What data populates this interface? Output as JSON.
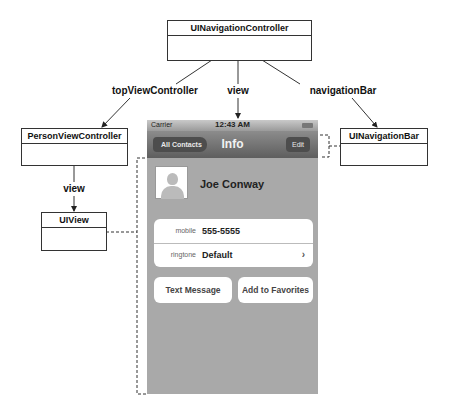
{
  "diagram": {
    "nodes": {
      "nav_controller": "UINavigationController",
      "person_vc": "PersonViewController",
      "ui_view": "UIView",
      "nav_bar": "UINavigationBar"
    },
    "edges": {
      "top_vc": "topViewController",
      "view_top": "view",
      "nav_bar": "navigationBar",
      "view_left": "view"
    }
  },
  "phone": {
    "status": {
      "carrier": "Carrier",
      "time": "12:43 AM"
    },
    "navbar": {
      "back": "All Contacts",
      "title": "Info",
      "edit": "Edit"
    },
    "contact": {
      "name": "Joe Conway"
    },
    "rows": [
      {
        "key": "mobile",
        "value": "555-5555"
      },
      {
        "key": "ringtone",
        "value": "Default",
        "chevron": "›"
      }
    ],
    "buttons": {
      "text_message": "Text Message",
      "add_favorites": "Add to Favorites"
    }
  },
  "colors": {
    "screen_bg": "#a9a9a9",
    "line": "#333333"
  }
}
